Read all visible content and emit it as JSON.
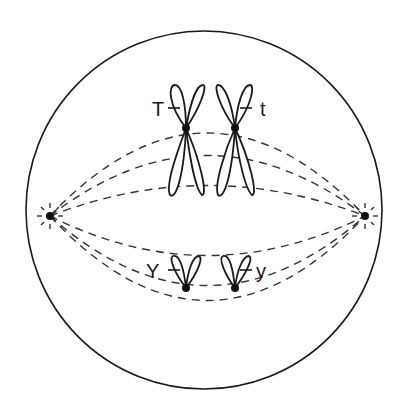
{
  "figure": {
    "type": "cell-division-diagram",
    "colors": {
      "line": "#1a1a1a",
      "background": "#ffffff"
    }
  },
  "cell": {
    "shape": "circle"
  },
  "poles": [
    {
      "name": "left-pole"
    },
    {
      "name": "right-pole"
    }
  ],
  "chromosomes": {
    "upper_pair": {
      "left_allele_label": "T",
      "right_allele_label": "t",
      "size": "large"
    },
    "lower_pair": {
      "left_allele_label": "Y",
      "right_allele_label": "y",
      "size": "small"
    }
  }
}
